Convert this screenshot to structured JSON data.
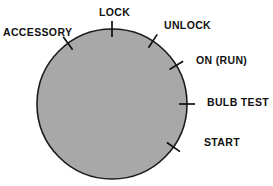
{
  "diagram": {
    "background_color": "#ffffff",
    "dial": {
      "name": "ignition-switch-dial",
      "fill_color": "#a8a8a8",
      "outline_color": "#1a1a1a",
      "center_x": 112,
      "center_y": 104,
      "radius": 75
    },
    "positions": [
      {
        "id": "accessory",
        "label": "ACCESSORY",
        "angle_deg": -36,
        "label_x": 3,
        "label_y": 27
      },
      {
        "id": "lock",
        "label": "LOCK",
        "angle_deg": 0,
        "label_x": 99,
        "label_y": 7
      },
      {
        "id": "unlock",
        "label": "UNLOCK",
        "angle_deg": 33,
        "label_x": 164,
        "label_y": 20
      },
      {
        "id": "on-run",
        "label": "ON (RUN)",
        "angle_deg": 59,
        "label_x": 196,
        "label_y": 55
      },
      {
        "id": "bulb-test",
        "label": "BULB TEST",
        "angle_deg": 90,
        "label_x": 207,
        "label_y": 97
      },
      {
        "id": "start",
        "label": "START",
        "angle_deg": 125,
        "label_x": 204,
        "label_y": 137
      }
    ]
  }
}
